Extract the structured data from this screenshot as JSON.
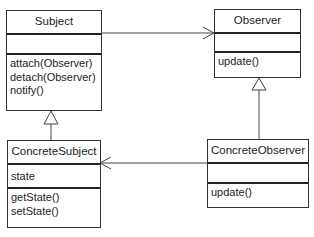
{
  "diagram": {
    "type": "uml-class",
    "classes": {
      "subject": {
        "name": "Subject",
        "attributes": [],
        "methods": [
          "attach(Observer)",
          "detach(Observer)",
          "notify()"
        ]
      },
      "observer": {
        "name": "Observer",
        "attributes": [],
        "methods": [
          "update()"
        ]
      },
      "concrete_subject": {
        "name": "ConcreteSubject",
        "attributes": [
          "state"
        ],
        "methods": [
          "getState()",
          "setState()"
        ]
      },
      "concrete_observer": {
        "name": "ConcreteObserver",
        "attributes": [],
        "methods": [
          "update()"
        ]
      }
    },
    "relationships": [
      {
        "from": "Subject",
        "to": "Observer",
        "kind": "association",
        "arrow": "open"
      },
      {
        "from": "ConcreteSubject",
        "to": "Subject",
        "kind": "generalization",
        "arrow": "hollow-triangle"
      },
      {
        "from": "ConcreteObserver",
        "to": "Observer",
        "kind": "generalization",
        "arrow": "hollow-triangle"
      },
      {
        "from": "ConcreteObserver",
        "to": "ConcreteSubject",
        "kind": "association",
        "arrow": "open"
      }
    ],
    "colors": {
      "line": "#333333",
      "box_border": "#333333",
      "background": "#ffffff"
    }
  }
}
